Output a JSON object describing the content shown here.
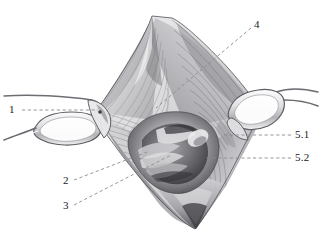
{
  "figure": {
    "type": "anatomical-surgical-illustration",
    "medium": "greyscale pencil drawing",
    "background_color": "#ffffff",
    "ink_color": "#19191c",
    "leader_line_color": "#8b8b8f",
    "width": 321,
    "height": 237
  },
  "callouts": [
    {
      "id": "callout-1",
      "label": "1",
      "label_x": 9,
      "label_y": 104,
      "line": {
        "x1": 22,
        "y1": 110,
        "x2": 98,
        "y2": 110
      },
      "style": "dashed-horizontal",
      "target": "left retractor blade"
    },
    {
      "id": "callout-2",
      "label": "2",
      "label_x": 63,
      "label_y": 175,
      "line": {
        "x1": 74,
        "y1": 180,
        "x2": 147,
        "y2": 152
      },
      "style": "dashed-diagonal",
      "target": "deep structure, lower centre-left"
    },
    {
      "id": "callout-3",
      "label": "3",
      "label_x": 63,
      "label_y": 200,
      "line": {
        "x1": 74,
        "y1": 205,
        "x2": 171,
        "y2": 155
      },
      "style": "dashed-diagonal",
      "target": "deep structure, lower centre"
    },
    {
      "id": "callout-4",
      "label": "4",
      "label_x": 254,
      "label_y": 19,
      "line": {
        "x1": 251,
        "y1": 28,
        "x2": 156,
        "y2": 108
      },
      "style": "dashed-diagonal",
      "target": "fanned fibre sheet, upper centre"
    },
    {
      "id": "callout-5-1",
      "label": "5.1",
      "label_x": 295,
      "label_y": 129,
      "line": {
        "x1": 291,
        "y1": 135,
        "x2": 222,
        "y2": 135
      },
      "style": "dashed-horizontal",
      "target": "right margin structure, upper"
    },
    {
      "id": "callout-5-2",
      "label": "5.2",
      "label_x": 295,
      "label_y": 152,
      "line": {
        "x1": 291,
        "y1": 158,
        "x2": 206,
        "y2": 158
      },
      "style": "dashed-horizontal",
      "target": "right margin structure, lower"
    }
  ]
}
